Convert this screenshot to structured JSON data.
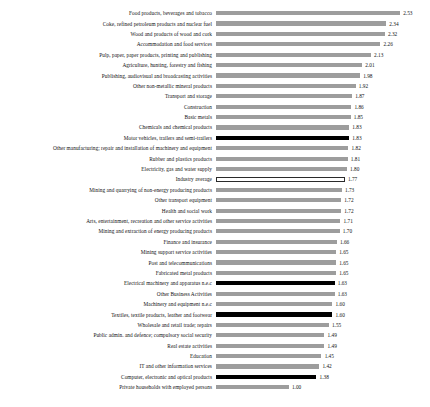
{
  "chart_data": {
    "type": "bar",
    "orientation": "horizontal",
    "title": "",
    "subtitle": "",
    "xlabel": "",
    "ylabel": "",
    "xlim": [
      0,
      2.53
    ],
    "grid": false,
    "legend": false,
    "value_labels": true,
    "colors": {
      "default_bar": "#9d9d9d",
      "highlight_bar": "#000000",
      "average_bar_fill": "#ffffff",
      "average_bar_outline": "#2b2b2b",
      "text": "#111111",
      "background": "#ffffff"
    },
    "categories": [
      "Food products, beverages and tobacco",
      "Coke, refined petroleum products and nuclear fuel",
      "Wood and products of wood and cork",
      "Accommodation and food services",
      "Pulp, paper, paper products, printing and publishing",
      "Agriculture, hunting, forestry and fishing",
      "Publishing, audiovisual and broadcasting activities",
      "Other non-metallic mineral products",
      "Transport and storage",
      "Construction",
      "Basic metals",
      "Chemicals and chemical products",
      "Motor vehicles, trailers and semi-trailers",
      "Other manufacturing; repair and installation of machinery and equipment",
      "Rubber and plastics products",
      "Electricity, gas and water supply",
      "Industry average",
      "Mining and quarrying of non-energy producing products",
      "Other transport equipment",
      "Health and social work",
      "Arts, entertainment, recreation and other service activities",
      "Mining and extraction of energy producing products",
      "Finance and insurance",
      "Mining support service activities",
      "Post and telecommunications",
      "Fabricated metal products",
      "Electrical machinery and apparatus n.e.c",
      "Other Business Activities",
      "Machinery and equipment n.e.c",
      "Textiles, textile products, leather and footwear",
      "Wholesale and retail trade; repairs",
      "Public admin. and defence; compulsory social security",
      "Real estate activities",
      "Education",
      "IT and other information services",
      "Computer, electronic and optical products",
      "Private households with employed persons"
    ],
    "values": [
      2.53,
      2.34,
      2.32,
      2.26,
      2.13,
      2.01,
      1.98,
      1.92,
      1.87,
      1.86,
      1.85,
      1.83,
      1.83,
      1.82,
      1.81,
      1.8,
      1.77,
      1.73,
      1.72,
      1.72,
      1.71,
      1.7,
      1.66,
      1.65,
      1.65,
      1.65,
      1.63,
      1.63,
      1.6,
      1.6,
      1.55,
      1.49,
      1.49,
      1.45,
      1.42,
      1.38,
      1.0
    ],
    "value_text": [
      "2.53",
      "2.34",
      "2.32",
      "2.26",
      "2.13",
      "2.01",
      "1.98",
      "1.92",
      "1.87",
      "1.86",
      "1.85",
      "1.83",
      "1.83",
      "1.82",
      "1.81",
      "1.80",
      "1.77",
      "1.73",
      "1.72",
      "1.72",
      "1.71",
      "1.70",
      "1.66",
      "1.65",
      "1.65",
      "1.65",
      "1.63",
      "1.63",
      "1.60",
      "1.60",
      "1.55",
      "1.49",
      "1.49",
      "1.45",
      "1.42",
      "1.38",
      "1.00"
    ],
    "styles": [
      "default",
      "default",
      "default",
      "default",
      "default",
      "default",
      "default",
      "default",
      "default",
      "default",
      "default",
      "default",
      "accent",
      "default",
      "default",
      "default",
      "average",
      "default",
      "default",
      "default",
      "default",
      "default",
      "default",
      "default",
      "default",
      "default",
      "accent",
      "default",
      "default",
      "accent",
      "default",
      "default",
      "default",
      "default",
      "default",
      "accent",
      "default"
    ]
  }
}
